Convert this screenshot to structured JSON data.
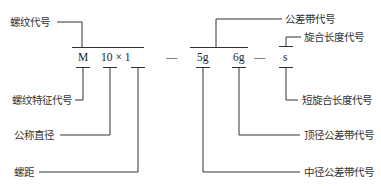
{
  "diagram": {
    "title": "",
    "code_parts": {
      "thread_char": "M",
      "size_pitch": "10 × 1",
      "dash1": "—",
      "pitch_tol": "5g",
      "crest_tol": "6g",
      "dash2": "—",
      "length": "s"
    },
    "labels": {
      "thread_code": "螺纹代号",
      "tolerance_code": "公差带代号",
      "engagement_length_code": "旋合长度代号",
      "thread_feature_code": "螺纹特征代号",
      "nominal_diameter": "公称直径",
      "pitch": "螺距",
      "short_engagement_code": "短旋合长度代号",
      "crest_diameter_tolerance": "顶径公差带代号",
      "pitch_diameter_tolerance": "中径公差带代号"
    },
    "line_color": "#333333"
  }
}
